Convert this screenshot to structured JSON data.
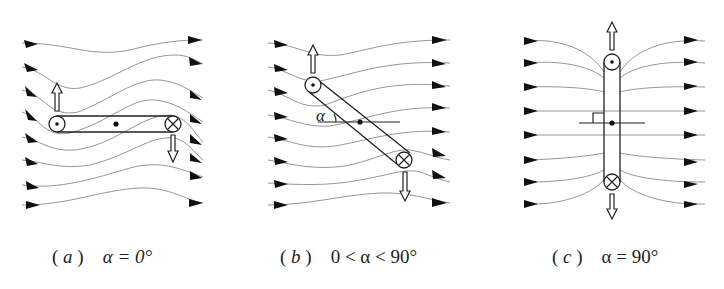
{
  "figure": {
    "panels": [
      {
        "id": "a",
        "label": "a",
        "condition": "α = 0°",
        "caption_open": "(",
        "caption_close": ")",
        "coil_angle_deg": 0,
        "current_top": "dot (out of page)",
        "current_bottom": "cross (into page)",
        "force_left": "up",
        "force_right": "down"
      },
      {
        "id": "b",
        "label": "b",
        "condition": "0 < α < 90°",
        "caption_open": "(",
        "caption_close": ")",
        "angle_symbol": "α",
        "coil_angle_deg": 40,
        "current_top": "dot (out of page)",
        "current_bottom": "cross (into page)",
        "force_left": "up",
        "force_right": "down"
      },
      {
        "id": "c",
        "label": "c",
        "condition": "α = 90°",
        "caption_open": "(",
        "caption_close": ")",
        "coil_angle_deg": 90,
        "current_top": "dot (out of page)",
        "current_bottom": "cross (into page)",
        "force_top": "up",
        "force_bottom": "down",
        "right_angle_marker": true
      }
    ],
    "field_direction": "left-to-right",
    "field_lines_per_panel": 8,
    "colors": {
      "field_line": "#8a8a8a",
      "ink": "#222222",
      "background": "#ffffff"
    }
  }
}
